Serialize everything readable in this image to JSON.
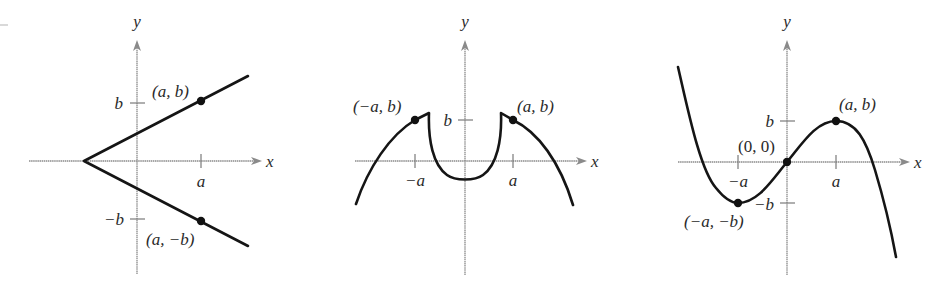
{
  "figures": [
    {
      "id": "graph-1",
      "axis_x_label": "x",
      "axis_y_label": "y",
      "tick_x_pos": "a",
      "tick_y_pos": "b",
      "tick_y_neg": "−b",
      "point_labels": [
        "(a, b)",
        "(a, −b)"
      ]
    },
    {
      "id": "graph-2",
      "axis_x_label": "x",
      "axis_y_label": "y",
      "tick_x_neg": "−a",
      "tick_x_pos": "a",
      "tick_y_pos": "b",
      "point_labels": [
        "(−a, b)",
        "(a, b)"
      ]
    },
    {
      "id": "graph-3",
      "axis_x_label": "x",
      "axis_y_label": "y",
      "tick_x_neg": "−a",
      "tick_x_pos": "a",
      "tick_y_pos": "b",
      "tick_y_neg": "−b",
      "point_labels": [
        "(a, b)",
        "(0, 0)",
        "(−a, −b)"
      ]
    }
  ],
  "colors": {
    "curve": "#151515",
    "axis": "#8a8a8a",
    "background": "#ffffff"
  }
}
